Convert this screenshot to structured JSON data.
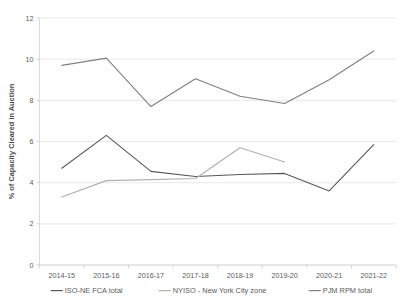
{
  "chart_data": {
    "type": "line",
    "title": "",
    "xlabel": "",
    "ylabel": "% of Capacity Cleared in Auction",
    "ylim": [
      0,
      12
    ],
    "yticks": [
      0,
      2,
      4,
      6,
      8,
      10,
      12
    ],
    "grid": "horizontal",
    "legend_position": "bottom-center",
    "categories": [
      "2014-15",
      "2015-16",
      "2016-17",
      "2017-18",
      "2018-19",
      "2019-20",
      "2020-21",
      "2021-22"
    ],
    "series": [
      {
        "name": "ISO-NE FCA total",
        "color": "#595959",
        "values": [
          4.7,
          6.3,
          4.55,
          4.3,
          4.4,
          4.45,
          3.6,
          5.85
        ]
      },
      {
        "name": "NYISO - New York City zone",
        "color": "#b0b0b0",
        "values": [
          3.3,
          4.1,
          4.15,
          4.2,
          5.7,
          5.0,
          null,
          null
        ]
      },
      {
        "name": "PJM RPM total",
        "color": "#808080",
        "values": [
          9.7,
          10.05,
          7.7,
          9.05,
          8.2,
          7.85,
          9.0,
          10.4
        ]
      }
    ]
  },
  "axis": {
    "y_title": "% of Capacity Cleared in Auction",
    "y_tick_labels": [
      "12",
      "10",
      "8",
      "6",
      "4",
      "2",
      "0"
    ],
    "x_tick_labels": [
      "2014-15",
      "2015-16",
      "2016-17",
      "2017-18",
      "2018-19",
      "2019-20",
      "2020-21",
      "2021-22"
    ]
  },
  "legend": {
    "items": [
      {
        "label": "ISO-NE FCA total",
        "color": "#595959"
      },
      {
        "label": "NYISO - New York City zone",
        "color": "#b0b0b0"
      },
      {
        "label": "PJM RPM total",
        "color": "#808080"
      }
    ]
  }
}
